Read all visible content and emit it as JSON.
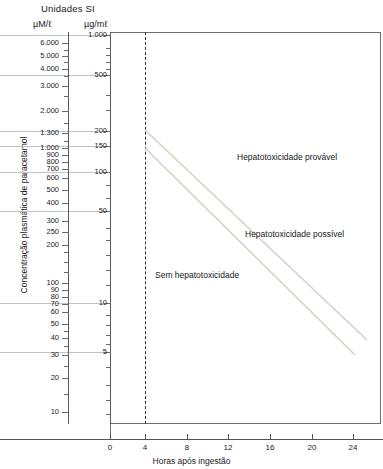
{
  "header": {
    "units_title": "Unidades SI",
    "left_axis_unit": "µM/ℓ",
    "right_axis_unit": "µg/mℓ"
  },
  "axes": {
    "y_title": "Concentração plasmática de paracetamol",
    "x_title": "Horas após ingestão"
  },
  "zones": {
    "provavel": "Hepatotoxicidade provável",
    "possivel": "Hepatotoxicidade possível",
    "sem": "Sem hepatotoxicidade"
  },
  "colors": {
    "gridline": "#b9c4cc",
    "frame": "#6e6e6e",
    "dashed_marker": "#22304a",
    "tox_line": "#d8cfc6",
    "text": "#1a1a1a"
  },
  "chart_data": {
    "type": "line",
    "xlabel": "Horas após ingestão",
    "ylabel": "Concentração plasmática de paracetamol",
    "xlim": [
      0,
      26
    ],
    "x_ticks": [
      0,
      4,
      8,
      12,
      16,
      20,
      24
    ],
    "x_tick_labels": [
      "0",
      "4",
      "8",
      "12",
      "16",
      "20",
      "24"
    ],
    "y_scale": "log",
    "y_axis_left": {
      "unit": "µM/ℓ",
      "ticks": [
        6000,
        5000,
        4000,
        3000,
        2000,
        1300,
        1000,
        900,
        800,
        700,
        600,
        500,
        400,
        300,
        250,
        200,
        100,
        90,
        80,
        70,
        60,
        50,
        40,
        30,
        20,
        10
      ],
      "tick_labels": [
        "6.000",
        "5.000",
        "4.000",
        "3.000",
        "2.000",
        "1.300",
        "1.000",
        "900",
        "800",
        "700",
        "600",
        "500",
        "400",
        "300",
        "250",
        "200",
        "100",
        "90",
        "80",
        "70",
        "60",
        "50",
        "40",
        "30",
        "20",
        "10"
      ]
    },
    "y_axis_right": {
      "unit": "µg/mℓ",
      "ticks": [
        1000,
        500,
        200,
        150,
        100,
        50,
        10,
        5
      ],
      "tick_labels": [
        "1.000",
        "500",
        "200",
        "150",
        "100",
        "50",
        "10",
        "5"
      ]
    },
    "gridlines": [
      1000,
      500,
      200,
      150,
      100,
      50,
      10,
      5
    ],
    "grid": true,
    "legend": "none",
    "annotations": [
      {
        "text": "Hepatotoxicidade provável",
        "region": "above upper line"
      },
      {
        "text": "Hepatotoxicidade possível",
        "region": "between lines"
      },
      {
        "text": "Sem hepatotoxicidade",
        "region": "below lower line"
      }
    ],
    "markers": [
      {
        "type": "vline",
        "x": 4,
        "style": "dashed",
        "label": "4 horas"
      }
    ],
    "series": [
      {
        "name": "Linha de hepatotoxicidade provável",
        "unit": "µg/mℓ",
        "points": [
          [
            4,
            200
          ],
          [
            24,
            7.5
          ]
        ],
        "style": "solid"
      },
      {
        "name": "Linha de tratamento (hepatotoxicidade possível)",
        "unit": "µg/mℓ",
        "points": [
          [
            4,
            150
          ],
          [
            24,
            5.6
          ]
        ],
        "style": "solid"
      }
    ]
  },
  "ticks_left": [
    {
      "label": "6.000",
      "y": 43
    },
    {
      "label": "5.000",
      "y": 56
    },
    {
      "label": "4.000",
      "y": 69
    },
    {
      "label": "3.000",
      "y": 86
    },
    {
      "label": "2.000",
      "y": 111
    },
    {
      "label": "1.300",
      "y": 133
    },
    {
      "label": "1.000",
      "y": 148
    },
    {
      "label": "900",
      "y": 155
    },
    {
      "label": "800",
      "y": 162
    },
    {
      "label": "700",
      "y": 169
    },
    {
      "label": "600",
      "y": 178
    },
    {
      "label": "500",
      "y": 190
    },
    {
      "label": "400",
      "y": 203
    },
    {
      "label": "300",
      "y": 221
    },
    {
      "label": "250",
      "y": 232
    },
    {
      "label": "200",
      "y": 245
    },
    {
      "label": "100",
      "y": 283
    },
    {
      "label": "90",
      "y": 290
    },
    {
      "label": "80",
      "y": 297
    },
    {
      "label": "70",
      "y": 304
    },
    {
      "label": "60",
      "y": 312
    },
    {
      "label": "50",
      "y": 324
    },
    {
      "label": "40",
      "y": 338
    },
    {
      "label": "30",
      "y": 355
    },
    {
      "label": "20",
      "y": 378
    },
    {
      "label": "10",
      "y": 412
    }
  ],
  "ticks_right": [
    {
      "label": "1.000",
      "y": 35
    },
    {
      "label": "500",
      "y": 75
    },
    {
      "label": "200",
      "y": 131
    },
    {
      "label": "150",
      "y": 146
    },
    {
      "label": "100",
      "y": 172
    },
    {
      "label": "50",
      "y": 211
    },
    {
      "label": "10",
      "y": 303
    },
    {
      "label": "5",
      "y": 352
    }
  ],
  "ticks_right_minor": [
    48,
    55,
    62,
    69,
    95,
    110,
    185,
    198,
    228,
    240,
    255,
    270,
    285,
    315,
    325,
    335,
    344,
    367,
    385,
    400,
    414
  ],
  "ticks_left_minor": [
    50,
    62,
    76,
    96,
    123,
    141,
    252,
    262,
    272,
    290,
    297,
    304,
    312,
    331,
    346,
    366,
    394
  ],
  "x_ticks": [
    {
      "label": "0",
      "x": 110
    },
    {
      "label": "4",
      "x": 145
    },
    {
      "label": "8",
      "x": 187
    },
    {
      "label": "12",
      "x": 228
    },
    {
      "label": "16",
      "x": 270
    },
    {
      "label": "20",
      "x": 312
    },
    {
      "label": "24",
      "x": 353
    }
  ],
  "gridline_rows": [
    {
      "y": 35,
      "full": true
    },
    {
      "y": 75,
      "full": true
    },
    {
      "y": 131,
      "full": true
    },
    {
      "y": 146,
      "full": true
    },
    {
      "y": 172,
      "full": true
    },
    {
      "y": 211,
      "full": true
    },
    {
      "y": 303,
      "full": true
    },
    {
      "y": 352,
      "full": true
    }
  ]
}
